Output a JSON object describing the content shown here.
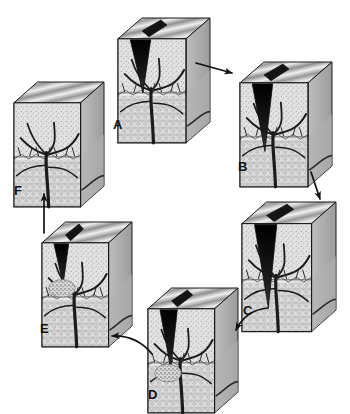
{
  "figure": {
    "background_color": "#ffffff",
    "ink_color": "#111111",
    "style": "grayscale medical line-and-tone illustration",
    "palette": {
      "cleft_dark": "#131313",
      "surface_light": "#e8e8e8",
      "surface_mid": "#b4b4b4",
      "surface_dark": "#8a8a8a",
      "stipple_layer": "#d9d9d9",
      "deep_layer": "#cfcfcf",
      "outline": "#1a1a1a"
    },
    "layout": "six blocks arranged clockwise in a ring",
    "arrow_color": "#111111"
  },
  "blocks": [
    {
      "id": "A",
      "label": "A",
      "x": 118,
      "y": 18,
      "w": 92,
      "h": 104,
      "label_x": 113,
      "label_y": 118,
      "cleft": {
        "present": true,
        "depth": 0.52,
        "width": 0.3,
        "fill": "#2e2e2e",
        "open": true
      },
      "granulation": false,
      "description": "Block with a partially open surface cleft and intact branching vessel tree"
    },
    {
      "id": "B",
      "label": "B",
      "x": 240,
      "y": 62,
      "w": 92,
      "h": 104,
      "label_x": 238,
      "label_y": 160,
      "cleft": {
        "present": true,
        "depth": 0.66,
        "width": 0.3,
        "fill": "#131313",
        "open": true
      },
      "granulation": false,
      "description": "Block with a deepened dark wedge-shaped cleft"
    },
    {
      "id": "C",
      "label": "C",
      "x": 242,
      "y": 202,
      "w": 94,
      "h": 108,
      "label_x": 243,
      "label_y": 304,
      "cleft": {
        "present": true,
        "depth": 0.78,
        "width": 0.32,
        "fill": "#0f0f0f",
        "open": true
      },
      "granulation": false,
      "description": "Block with the deepest, widest cleft reaching toward the vessel tree"
    },
    {
      "id": "D",
      "label": "D",
      "x": 148,
      "y": 288,
      "w": 90,
      "h": 104,
      "label_x": 148,
      "label_y": 388,
      "cleft": {
        "present": true,
        "depth": 0.58,
        "width": 0.26,
        "fill": "#151515",
        "open": true
      },
      "granulation": true,
      "description": "Block with cleft narrowing and stippled granulation tissue forming at its base"
    },
    {
      "id": "E",
      "label": "E",
      "x": 42,
      "y": 222,
      "w": 90,
      "h": 104,
      "label_x": 40,
      "label_y": 322,
      "cleft": {
        "present": true,
        "depth": 0.4,
        "width": 0.22,
        "fill": "#1a1a1a",
        "open": true
      },
      "granulation": true,
      "description": "Block with a shallow residual cleft and dense repair tissue beneath"
    },
    {
      "id": "F",
      "label": "F",
      "x": 14,
      "y": 82,
      "w": 90,
      "h": 104,
      "label_x": 14,
      "label_y": 184,
      "cleft": {
        "present": false,
        "depth": 0,
        "width": 0,
        "fill": "none",
        "open": false
      },
      "granulation": false,
      "description": "Block fully healed with an unbroken continuous surface"
    }
  ],
  "arrows": [
    {
      "id": "a-to-b",
      "from": "A",
      "to": "B",
      "kind": "straight",
      "direction": "right-down",
      "x1": 196,
      "y1": 63,
      "x2": 232,
      "y2": 73
    },
    {
      "id": "b-to-c",
      "from": "B",
      "to": "C",
      "kind": "straight",
      "direction": "down",
      "x1": 311,
      "y1": 172,
      "x2": 320,
      "y2": 199
    },
    {
      "id": "c-to-d",
      "from": "C",
      "to": "D",
      "kind": "curved",
      "direction": "down-left",
      "x1": 268,
      "y1": 308,
      "x2": 236,
      "y2": 330
    },
    {
      "id": "d-to-e",
      "from": "D",
      "to": "E",
      "kind": "curved",
      "direction": "up-left",
      "x1": 152,
      "y1": 354,
      "x2": 112,
      "y2": 336
    },
    {
      "id": "e-to-f",
      "from": "E",
      "to": "F",
      "kind": "straight",
      "direction": "up",
      "x1": 44,
      "y1": 233,
      "x2": 44,
      "y2": 194
    }
  ]
}
